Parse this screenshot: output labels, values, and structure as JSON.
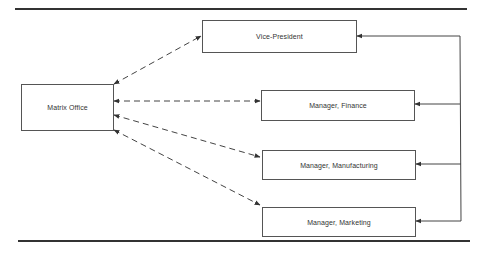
{
  "diagram": {
    "type": "organization-matrix",
    "nodes": [
      {
        "id": "matrix_office",
        "label": "Matrix Office"
      },
      {
        "id": "vice_president",
        "label": "Vice-President"
      },
      {
        "id": "manager_finance",
        "label": "Manager, Finance"
      },
      {
        "id": "manager_manufacturing",
        "label": "Manager, Manufacturing"
      },
      {
        "id": "manager_marketing",
        "label": "Manager, Marketing"
      }
    ],
    "edges": [
      {
        "from": "matrix_office",
        "to": "vice_president",
        "style": "dashed",
        "arrows": "both"
      },
      {
        "from": "matrix_office",
        "to": "manager_finance",
        "style": "dashed",
        "arrows": "both"
      },
      {
        "from": "matrix_office",
        "to": "manager_manufacturing",
        "style": "dashed",
        "arrows": "both"
      },
      {
        "from": "matrix_office",
        "to": "manager_marketing",
        "style": "dashed",
        "arrows": "both"
      },
      {
        "from": "vice_president",
        "to": "manager_finance",
        "style": "solid",
        "arrows": "end"
      },
      {
        "from": "vice_president",
        "to": "manager_manufacturing",
        "style": "solid",
        "arrows": "end"
      },
      {
        "from": "vice_president",
        "to": "manager_marketing",
        "style": "solid",
        "arrows": "end"
      }
    ]
  },
  "boxes": {
    "matrix_office": "Matrix Office",
    "vice_president": "Vice-President",
    "manager_finance": "Manager, Finance",
    "manager_manufacturing": "Manager, Manufacturing",
    "manager_marketing": "Manager, Marketing"
  }
}
